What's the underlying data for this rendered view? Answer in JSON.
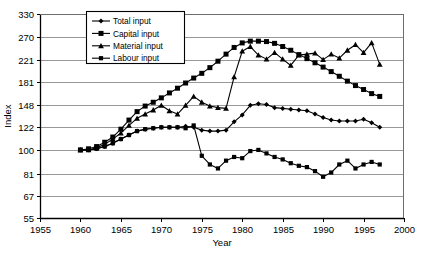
{
  "chart_data": {
    "type": "line",
    "title": "",
    "xlabel": "Year",
    "ylabel": "Index",
    "yscale": "log",
    "xlim": [
      1955,
      2000
    ],
    "ylim": [
      55,
      330
    ],
    "grid": true,
    "grid_axis": "y",
    "legend_position": "top-left-inside",
    "xticks": [
      1955,
      1960,
      1965,
      1970,
      1975,
      1980,
      1985,
      1990,
      1995,
      2000
    ],
    "yticks": [
      55,
      67,
      81,
      100,
      122,
      148,
      181,
      221,
      270,
      330
    ],
    "x": [
      1960,
      1961,
      1962,
      1963,
      1964,
      1965,
      1966,
      1967,
      1968,
      1969,
      1970,
      1971,
      1972,
      1973,
      1974,
      1975,
      1976,
      1977,
      1978,
      1979,
      1980,
      1981,
      1982,
      1983,
      1984,
      1985,
      1986,
      1987,
      1988,
      1989,
      1990,
      1991,
      1992,
      1993,
      1994,
      1995,
      1996,
      1997
    ],
    "series": [
      {
        "name": "Total input",
        "marker": "diamond",
        "color": "#000000",
        "values": [
          100,
          100,
          101,
          103,
          106,
          110,
          114,
          118,
          120,
          121,
          122,
          122,
          122,
          123,
          122,
          119,
          118,
          118,
          119,
          128,
          136,
          148,
          150,
          149,
          145,
          144,
          143,
          142,
          141,
          137,
          133,
          130,
          129,
          129,
          129,
          131,
          127,
          122
        ]
      },
      {
        "name": "Capital input",
        "marker": "square",
        "color": "#000000",
        "values": [
          100,
          101,
          103,
          107,
          112,
          120,
          130,
          140,
          147,
          152,
          158,
          165,
          172,
          180,
          188,
          196,
          206,
          218,
          232,
          246,
          256,
          260,
          260,
          259,
          255,
          248,
          240,
          231,
          223,
          215,
          207,
          199,
          191,
          183,
          176,
          170,
          164,
          160
        ]
      },
      {
        "name": "Material input",
        "marker": "triangle",
        "color": "#000000",
        "values": [
          100,
          100,
          102,
          105,
          110,
          116,
          124,
          132,
          137,
          142,
          148,
          141,
          137,
          148,
          160,
          152,
          147,
          145,
          144,
          190,
          238,
          248,
          230,
          222,
          235,
          222,
          210,
          230,
          232,
          234,
          221,
          232,
          224,
          240,
          252,
          235,
          256,
          212
        ]
      },
      {
        "name": "Labour input",
        "marker": "square-small",
        "color": "#000000",
        "values": [
          100,
          100,
          101,
          103,
          106,
          110,
          114,
          118,
          120,
          121,
          122,
          122,
          122,
          121,
          124,
          95,
          88,
          85,
          91,
          94,
          93,
          99,
          100,
          97,
          94,
          92,
          89,
          87,
          86,
          83,
          79,
          82,
          88,
          91,
          85,
          88,
          90,
          88
        ]
      }
    ]
  },
  "legend": {
    "entries": [
      {
        "label": "Total input",
        "marker": "diamond"
      },
      {
        "label": "Capital input",
        "marker": "square"
      },
      {
        "label": "Material input",
        "marker": "triangle"
      },
      {
        "label": "Labour input",
        "marker": "square-small"
      }
    ]
  },
  "axes": {
    "x_title": "Year",
    "y_title": "Index",
    "x_tick_labels": [
      "1955",
      "1960",
      "1965",
      "1970",
      "1975",
      "1980",
      "1985",
      "1990",
      "1995",
      "2000"
    ],
    "y_tick_labels": [
      "55",
      "67",
      "81",
      "100",
      "122",
      "148",
      "181",
      "221",
      "270",
      "330"
    ]
  }
}
